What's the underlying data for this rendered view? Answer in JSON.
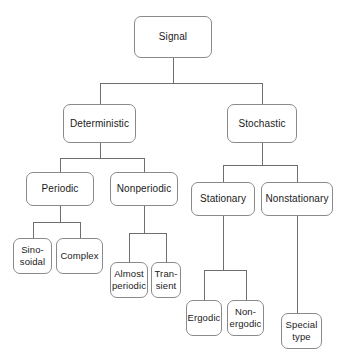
{
  "diagram": {
    "type": "tree",
    "style": {
      "background": "#ffffff",
      "node_fill": "#ffffff",
      "node_border": "#8a8a8a",
      "edge_color": "#6e6e6e",
      "text_color": "#1a1a1a"
    },
    "nodes": [
      {
        "id": "signal",
        "label": "Signal",
        "level": 0,
        "x": 134,
        "y": 16,
        "w": 78,
        "h": 42
      },
      {
        "id": "deterministic",
        "label": "Deterministic",
        "level": 1,
        "x": 63,
        "y": 104,
        "w": 73,
        "h": 39
      },
      {
        "id": "stochastic",
        "label": "Stochastic",
        "level": 1,
        "x": 227,
        "y": 104,
        "w": 70,
        "h": 39
      },
      {
        "id": "periodic",
        "label": "Periodic",
        "level": 2,
        "x": 26,
        "y": 172,
        "w": 68,
        "h": 34
      },
      {
        "id": "nonperiodic",
        "label": "Nonperiodic",
        "level": 2,
        "x": 110,
        "y": 172,
        "w": 68,
        "h": 34
      },
      {
        "id": "stationary",
        "label": "Stationary",
        "level": 2,
        "x": 191,
        "y": 182,
        "w": 64,
        "h": 34
      },
      {
        "id": "nonstationary",
        "label": "Nonstationary",
        "level": 2,
        "x": 261,
        "y": 182,
        "w": 72,
        "h": 34
      },
      {
        "id": "sinosoidal",
        "label": "Sino-\nsoidal",
        "level": 3,
        "x": 13,
        "y": 238,
        "w": 39,
        "h": 36
      },
      {
        "id": "complex",
        "label": "Complex",
        "level": 3,
        "x": 56,
        "y": 238,
        "w": 47,
        "h": 36
      },
      {
        "id": "almost_periodic",
        "label": "Almost\nperiodic",
        "level": 3,
        "x": 110,
        "y": 262,
        "w": 38,
        "h": 36
      },
      {
        "id": "transient",
        "label": "Tran-\nsient",
        "level": 3,
        "x": 151,
        "y": 262,
        "w": 30,
        "h": 36
      },
      {
        "id": "ergodic",
        "label": "Ergodic",
        "level": 3,
        "x": 186,
        "y": 300,
        "w": 36,
        "h": 36
      },
      {
        "id": "nonergodic",
        "label": "Non-\nergodic",
        "level": 3,
        "x": 227,
        "y": 300,
        "w": 37,
        "h": 36
      },
      {
        "id": "special_type",
        "label": "Special\ntype",
        "level": 3,
        "x": 281,
        "y": 313,
        "w": 41,
        "h": 36
      }
    ],
    "edges": [
      {
        "from": "signal",
        "to": "deterministic",
        "kind": "orthogonal",
        "bus_y": 83
      },
      {
        "from": "signal",
        "to": "stochastic",
        "kind": "orthogonal",
        "bus_y": 83
      },
      {
        "from": "deterministic",
        "to": "periodic",
        "kind": "orthogonal",
        "bus_y": 158
      },
      {
        "from": "deterministic",
        "to": "nonperiodic",
        "kind": "orthogonal",
        "bus_y": 158
      },
      {
        "from": "stochastic",
        "to": "stationary",
        "kind": "orthogonal",
        "bus_y": 165
      },
      {
        "from": "stochastic",
        "to": "nonstationary",
        "kind": "orthogonal",
        "bus_y": 165
      },
      {
        "from": "periodic",
        "to": "sinosoidal",
        "kind": "orthogonal",
        "bus_y": 222
      },
      {
        "from": "periodic",
        "to": "complex",
        "kind": "orthogonal",
        "bus_y": 222
      },
      {
        "from": "nonperiodic",
        "to": "almost_periodic",
        "kind": "orthogonal",
        "bus_y": 233
      },
      {
        "from": "nonperiodic",
        "to": "transient",
        "kind": "orthogonal",
        "bus_y": 233
      },
      {
        "from": "stationary",
        "to": "ergodic",
        "kind": "orthogonal",
        "bus_y": 270
      },
      {
        "from": "stationary",
        "to": "nonergodic",
        "kind": "orthogonal",
        "bus_y": 270
      },
      {
        "from": "nonstationary",
        "to": "special_type",
        "kind": "straight",
        "bus_y": null
      }
    ]
  }
}
